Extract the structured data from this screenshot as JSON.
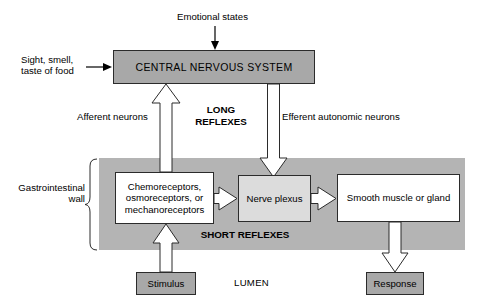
{
  "figure": {
    "colors": {
      "cns_fill": "#a8a8a8",
      "gi_wall_fill": "#b4b4b4",
      "plexus_fill": "#dcdcdc",
      "box_fill": "#ffffff",
      "stroke": "#2b2b2b",
      "text": "#000000",
      "background": "#ffffff"
    }
  },
  "nodes": {
    "cns": "CENTRAL NERVOUS SYSTEM",
    "receptors": "Chemoreceptors, osmoreceptors, or mechanoreceptors",
    "plexus": "Nerve plexus",
    "effector": "Smooth muscle or gland",
    "stimulus": "Stimulus",
    "response": "Response"
  },
  "labels": {
    "emotional_states": "Emotional states",
    "sight_smell_taste": "Sight, smell,\ntaste of food",
    "afferent_neurons": "Afferent neurons",
    "efferent_neurons": "Efferent autonomic neurons",
    "long_reflexes": "LONG\nREFLEXES",
    "short_reflexes": "SHORT REFLEXES",
    "gastrointestinal_wall": "Gastrointestinal\nwall",
    "lumen": "LUMEN"
  }
}
